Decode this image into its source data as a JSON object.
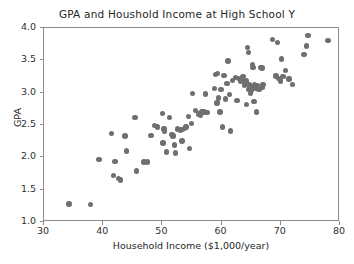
{
  "chart_data": {
    "type": "scatter",
    "title": "GPA and Houshold Income at High School Y",
    "xlabel": "Household Income ($1,000/year)",
    "ylabel": "GPA",
    "xlim": [
      30,
      80
    ],
    "ylim": [
      1.0,
      4.0
    ],
    "xticks": [
      30,
      40,
      50,
      60,
      70,
      80
    ],
    "xtick_labels": [
      "30",
      "40",
      "50",
      "60",
      "70",
      "80"
    ],
    "yticks": [
      1.0,
      1.5,
      2.0,
      2.5,
      3.0,
      3.5,
      4.0
    ],
    "ytick_labels": [
      "1.0",
      "1.5",
      "2.0",
      "2.5",
      "3.0",
      "3.5",
      "4.0"
    ],
    "grid": false,
    "legend": null,
    "marker_color": "#6f6f6f",
    "marker_shape": "circle",
    "marker_size_px": 5.4,
    "n_points": 104,
    "points": [
      [
        34.2,
        1.28
      ],
      [
        37.9,
        1.27
      ],
      [
        39.3,
        1.97
      ],
      [
        41.4,
        2.37
      ],
      [
        41.7,
        1.72
      ],
      [
        42.0,
        1.94
      ],
      [
        42.6,
        1.67
      ],
      [
        42.9,
        1.65
      ],
      [
        43.7,
        2.33
      ],
      [
        43.9,
        2.1
      ],
      [
        45.4,
        2.62
      ],
      [
        45.6,
        1.79
      ],
      [
        46.9,
        1.93
      ],
      [
        47.5,
        1.93
      ],
      [
        48.1,
        2.34
      ],
      [
        48.7,
        2.49
      ],
      [
        49.2,
        2.47
      ],
      [
        50.0,
        2.68
      ],
      [
        50.1,
        2.22
      ],
      [
        50.3,
        2.44
      ],
      [
        50.4,
        2.4
      ],
      [
        50.7,
        2.08
      ],
      [
        51.2,
        2.62
      ],
      [
        51.6,
        2.35
      ],
      [
        51.8,
        2.33
      ],
      [
        52.0,
        2.19
      ],
      [
        52.2,
        2.07
      ],
      [
        52.6,
        2.44
      ],
      [
        53.1,
        2.42
      ],
      [
        53.3,
        2.25
      ],
      [
        53.4,
        2.43
      ],
      [
        53.7,
        2.45
      ],
      [
        54.0,
        2.47
      ],
      [
        54.4,
        2.63
      ],
      [
        54.6,
        2.14
      ],
      [
        54.9,
        2.52
      ],
      [
        55.1,
        2.99
      ],
      [
        55.6,
        2.72
      ],
      [
        56.1,
        2.67
      ],
      [
        56.4,
        2.65
      ],
      [
        56.7,
        2.71
      ],
      [
        57.0,
        2.7
      ],
      [
        57.3,
        2.98
      ],
      [
        57.5,
        2.69
      ],
      [
        58.8,
        3.06
      ],
      [
        59.0,
        3.28
      ],
      [
        59.2,
        2.84
      ],
      [
        59.3,
        3.3
      ],
      [
        59.5,
        2.92
      ],
      [
        59.7,
        2.7
      ],
      [
        59.9,
        3.05
      ],
      [
        60.1,
        2.47
      ],
      [
        60.4,
        3.27
      ],
      [
        60.7,
        2.9
      ],
      [
        60.9,
        3.14
      ],
      [
        61.1,
        3.49
      ],
      [
        61.3,
        2.97
      ],
      [
        61.5,
        2.41
      ],
      [
        61.8,
        3.19
      ],
      [
        62.3,
        3.23
      ],
      [
        62.6,
        2.88
      ],
      [
        62.9,
        3.22
      ],
      [
        63.2,
        3.17
      ],
      [
        63.5,
        3.19
      ],
      [
        63.6,
        3.25
      ],
      [
        63.9,
        3.12
      ],
      [
        64.1,
        3.18
      ],
      [
        64.2,
        2.82
      ],
      [
        64.4,
        3.7
      ],
      [
        64.5,
        3.62
      ],
      [
        64.6,
        3.05
      ],
      [
        64.7,
        3.12
      ],
      [
        64.8,
        3.08
      ],
      [
        64.9,
        2.99
      ],
      [
        65.1,
        3.03
      ],
      [
        65.2,
        3.44
      ],
      [
        65.3,
        3.39
      ],
      [
        65.4,
        3.08
      ],
      [
        65.5,
        2.86
      ],
      [
        65.6,
        3.12
      ],
      [
        65.8,
        3.07
      ],
      [
        65.9,
        2.7
      ],
      [
        66.1,
        3.11
      ],
      [
        66.3,
        3.05
      ],
      [
        66.6,
        3.39
      ],
      [
        66.8,
        3.38
      ],
      [
        66.9,
        3.09
      ],
      [
        67.0,
        3.13
      ],
      [
        68.6,
        3.82
      ],
      [
        69.2,
        3.26
      ],
      [
        69.4,
        3.78
      ],
      [
        69.6,
        3.22
      ],
      [
        69.9,
        3.18
      ],
      [
        70.1,
        3.52
      ],
      [
        70.4,
        3.25
      ],
      [
        70.8,
        3.34
      ],
      [
        71.4,
        3.21
      ],
      [
        72.0,
        3.13
      ],
      [
        73.9,
        3.59
      ],
      [
        74.3,
        3.72
      ],
      [
        74.6,
        3.88
      ],
      [
        78.0,
        3.81
      ]
    ]
  }
}
